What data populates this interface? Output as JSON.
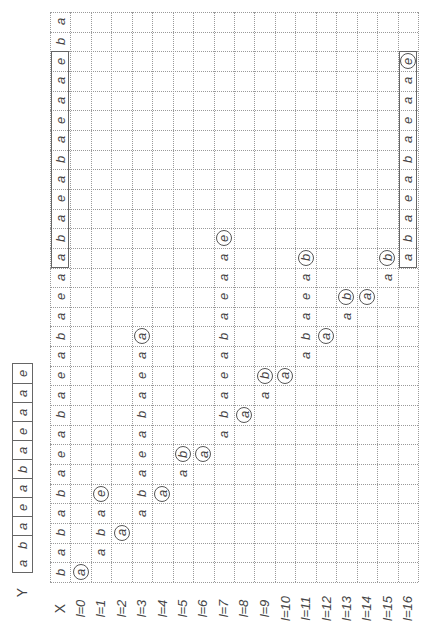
{
  "figure": {
    "orientation": "rotated-90-ccw",
    "y_label": "Y",
    "y_string": [
      "a",
      "b",
      "a",
      "e",
      "a",
      "b",
      "a",
      "e",
      "a",
      "a",
      "e"
    ],
    "column_labels": [
      "X",
      "l=0",
      "l=1",
      "l=2",
      "l=3",
      "l=4",
      "l=5",
      "l=6",
      "l=7",
      "l=8",
      "l=9",
      "l=10",
      "l=11",
      "l=12",
      "l=13",
      "l=14",
      "l=15",
      "l=16"
    ],
    "row_count": 29,
    "x_string": [
      "b",
      "a",
      "b",
      "a",
      "b",
      "a",
      "e",
      "a",
      "b",
      "a",
      "e",
      "a",
      "b",
      "a",
      "e",
      "a",
      "a",
      "b",
      "a",
      "e",
      "a",
      "b",
      "a",
      "e",
      "a",
      "a",
      "e",
      "b",
      "a"
    ],
    "x_box_rows": [
      16,
      26
    ],
    "columns": [
      {
        "label": "l=0",
        "start_row": 0,
        "chars": [
          "a"
        ],
        "circled_last": true
      },
      {
        "label": "l=1",
        "start_row": 1,
        "chars": [
          "a",
          "b",
          "a",
          "e"
        ],
        "circled_last": true
      },
      {
        "label": "l=2",
        "start_row": 2,
        "chars": [
          "a"
        ],
        "circled_last": true
      },
      {
        "label": "l=3",
        "start_row": 3,
        "chars": [
          "a",
          "b",
          "a",
          "e",
          "a",
          "b",
          "a",
          "e",
          "a",
          "a"
        ],
        "circled_last": true
      },
      {
        "label": "l=4",
        "start_row": 4,
        "chars": [
          "a"
        ],
        "circled_last": true
      },
      {
        "label": "l=5",
        "start_row": 5,
        "chars": [
          "a",
          "b"
        ],
        "circled_last": true
      },
      {
        "label": "l=6",
        "start_row": 6,
        "chars": [
          "a"
        ],
        "circled_last": true
      },
      {
        "label": "l=7",
        "start_row": 7,
        "chars": [
          "a",
          "b",
          "a",
          "e",
          "a",
          "b",
          "a",
          "e",
          "a",
          "a",
          "e"
        ],
        "circled_last": true
      },
      {
        "label": "l=8",
        "start_row": 8,
        "chars": [
          "a"
        ],
        "circled_last": true
      },
      {
        "label": "l=9",
        "start_row": 9,
        "chars": [
          "a",
          "b"
        ],
        "circled_last": true
      },
      {
        "label": "l=10",
        "start_row": 10,
        "chars": [
          "a"
        ],
        "circled_last": true
      },
      {
        "label": "l=11",
        "start_row": 11,
        "chars": [
          "a",
          "b",
          "a",
          "e",
          "a",
          "b"
        ],
        "circled_last": true
      },
      {
        "label": "l=12",
        "start_row": 12,
        "chars": [
          "a"
        ],
        "circled_last": true
      },
      {
        "label": "l=13",
        "start_row": 13,
        "chars": [
          "a",
          "b"
        ],
        "circled_last": true
      },
      {
        "label": "l=14",
        "start_row": 14,
        "chars": [
          "a"
        ],
        "circled_last": true
      },
      {
        "label": "l=15",
        "start_row": 15,
        "chars": [
          "a",
          "b"
        ],
        "circled_last": true
      },
      {
        "label": "l=16",
        "start_row": 16,
        "chars": [
          "a",
          "b",
          "a",
          "e",
          "a",
          "b",
          "a",
          "e",
          "a",
          "a",
          "e"
        ],
        "circled_last": true,
        "boxed": true
      }
    ]
  },
  "colors": {
    "background": "#ffffff",
    "grid": "#9a9a9a",
    "text": "#444444",
    "box": "#666666"
  }
}
